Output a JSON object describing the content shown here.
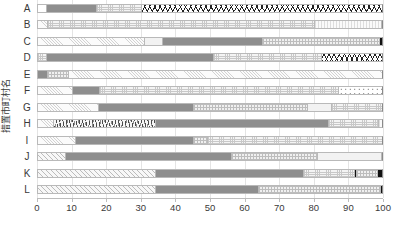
{
  "chart_data": {
    "type": "bar",
    "orientation": "horizontal",
    "stacked": true,
    "stack_mode": "percent",
    "title": "",
    "xlabel": "",
    "ylabel": "措置市町村名",
    "xlim": [
      0,
      100
    ],
    "xticks": [
      0,
      10,
      20,
      30,
      40,
      50,
      60,
      70,
      80,
      90,
      100
    ],
    "grid": true,
    "legend": "none",
    "categories": [
      "A",
      "B",
      "C",
      "D",
      "E",
      "F",
      "G",
      "H",
      "I",
      "J",
      "K",
      "L"
    ],
    "rows": [
      {
        "category": "A",
        "segments": [
          {
            "pattern": "white",
            "start": 0,
            "value": 2.6
          },
          {
            "pattern": "solidgray",
            "start": 2.6,
            "value": 14.4
          },
          {
            "pattern": "dots",
            "start": 17.0,
            "value": 13.0
          },
          {
            "pattern": "squiggle",
            "start": 30.0,
            "value": 70.0
          }
        ]
      },
      {
        "category": "B",
        "segments": [
          {
            "pattern": "hatch",
            "start": 0,
            "value": 3.0
          },
          {
            "pattern": "dots",
            "start": 3.0,
            "value": 77.0
          },
          {
            "pattern": "vstripe",
            "start": 80.0,
            "value": 19.3
          },
          {
            "pattern": "solidgray",
            "start": 99.3,
            "value": 0.7
          }
        ]
      },
      {
        "category": "C",
        "segments": [
          {
            "pattern": "hatch",
            "start": 0,
            "value": 31.0
          },
          {
            "pattern": "lightsolid",
            "start": 31.0,
            "value": 5.0
          },
          {
            "pattern": "solidgray",
            "start": 36.0,
            "value": 29.0
          },
          {
            "pattern": "checker",
            "start": 65.0,
            "value": 33.8
          },
          {
            "pattern": "black",
            "start": 98.8,
            "value": 1.2
          }
        ]
      },
      {
        "category": "D",
        "segments": [
          {
            "pattern": "dots",
            "start": 0,
            "value": 2.5
          },
          {
            "pattern": "solidgray",
            "start": 2.5,
            "value": 48.5
          },
          {
            "pattern": "dots",
            "start": 51.0,
            "value": 31.0
          },
          {
            "pattern": "squiggle",
            "start": 82.0,
            "value": 18.0
          }
        ]
      },
      {
        "category": "E",
        "segments": [
          {
            "pattern": "solidgray",
            "start": 0,
            "value": 3.0
          },
          {
            "pattern": "checker",
            "start": 3.0,
            "value": 6.0
          },
          {
            "pattern": "hatch",
            "start": 9.0,
            "value": 91.0
          }
        ]
      },
      {
        "category": "F",
        "segments": [
          {
            "pattern": "hatch",
            "start": 0,
            "value": 10.0
          },
          {
            "pattern": "solidgray",
            "start": 10.0,
            "value": 8.0
          },
          {
            "pattern": "dots",
            "start": 18.0,
            "value": 69.0
          },
          {
            "pattern": "polka",
            "start": 87.0,
            "value": 13.0
          }
        ]
      },
      {
        "category": "G",
        "segments": [
          {
            "pattern": "hatch",
            "start": 0,
            "value": 17.5
          },
          {
            "pattern": "solidgray",
            "start": 17.5,
            "value": 27.5
          },
          {
            "pattern": "checker",
            "start": 45.0,
            "value": 33.0
          },
          {
            "pattern": "lightsolid",
            "start": 78.0,
            "value": 7.0
          },
          {
            "pattern": "dots",
            "start": 85.0,
            "value": 15.0
          }
        ]
      },
      {
        "category": "H",
        "segments": [
          {
            "pattern": "hatch",
            "start": 0,
            "value": 4.5
          },
          {
            "pattern": "scribble",
            "start": 4.5,
            "value": 29.5
          },
          {
            "pattern": "solidgray",
            "start": 34.0,
            "value": 50.0
          },
          {
            "pattern": "dots",
            "start": 84.0,
            "value": 14.5
          },
          {
            "pattern": "vstripe",
            "start": 98.5,
            "value": 1.5
          }
        ]
      },
      {
        "category": "I",
        "segments": [
          {
            "pattern": "hatch",
            "start": 0,
            "value": 11.0
          },
          {
            "pattern": "solidgray",
            "start": 11.0,
            "value": 34.0
          },
          {
            "pattern": "checker",
            "start": 45.0,
            "value": 4.0
          },
          {
            "pattern": "dots",
            "start": 49.0,
            "value": 51.0
          }
        ]
      },
      {
        "category": "J",
        "segments": [
          {
            "pattern": "diag",
            "start": 0,
            "value": 8.0
          },
          {
            "pattern": "solidgray",
            "start": 8.0,
            "value": 48.0
          },
          {
            "pattern": "checker",
            "start": 56.0,
            "value": 25.0
          },
          {
            "pattern": "lightsolid",
            "start": 81.0,
            "value": 18.4
          },
          {
            "pattern": "solidgray",
            "start": 99.4,
            "value": 0.6
          }
        ]
      },
      {
        "category": "K",
        "segments": [
          {
            "pattern": "diag",
            "start": 0,
            "value": 34.0
          },
          {
            "pattern": "solidgray",
            "start": 34.0,
            "value": 43.0
          },
          {
            "pattern": "dots",
            "start": 77.0,
            "value": 14.5
          },
          {
            "pattern": "black",
            "start": 91.5,
            "value": 0.8
          },
          {
            "pattern": "checker",
            "start": 92.3,
            "value": 6.0
          },
          {
            "pattern": "black",
            "start": 98.3,
            "value": 1.7
          }
        ]
      },
      {
        "category": "L",
        "segments": [
          {
            "pattern": "diag",
            "start": 0,
            "value": 34.0
          },
          {
            "pattern": "solidgray",
            "start": 34.0,
            "value": 30.0
          },
          {
            "pattern": "checker",
            "start": 64.0,
            "value": 35.0
          },
          {
            "pattern": "black",
            "start": 99.0,
            "value": 1.0
          }
        ]
      }
    ]
  },
  "axis": {
    "y_title": "措置市町村名",
    "x_tick_labels": [
      "0",
      "10",
      "20",
      "30",
      "40",
      "50",
      "60",
      "70",
      "80",
      "90",
      "100"
    ]
  },
  "colors": {
    "solid_gray": "#8e8e8e",
    "black": "#111111",
    "gridline": "#e4e4e4",
    "border": "#b9b9b9",
    "text": "#3a3a3a"
  }
}
